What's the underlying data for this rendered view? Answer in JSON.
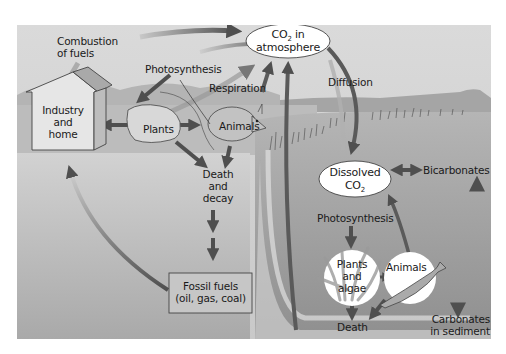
{
  "colors": {
    "sky_top": "#d9d9d9",
    "sky_bottom": "#c4c4c4",
    "mountains": "#a8a8a8",
    "land": "#bdbdbd",
    "ground": "#cfcfcf",
    "water": "#9c9c9c",
    "water_deep": "#8a8a8a",
    "arrow": "#5a5a5a",
    "arrow_light": "#b0b0b0",
    "oval_fill": "#ffffff",
    "box_fill": "#c8c8c8",
    "text": "#1a1a1a"
  },
  "nodes": {
    "co2_atmosphere": {
      "line1": "CO",
      "sub": "2",
      "line1_suffix": " in",
      "line2": "atmosphere"
    },
    "industry_home": {
      "line1": "Industry",
      "line2": "and",
      "line3": "home"
    },
    "plants": {
      "label": "Plants"
    },
    "animals_land": {
      "label": "Animals"
    },
    "death_decay": {
      "line1": "Death",
      "line2": "and",
      "line3": "decay"
    },
    "fossil_fuels": {
      "line1": "Fossil fuels",
      "line2": "(oil, gas, coal)"
    },
    "dissolved_co2": {
      "line1": "Dissolved",
      "line2": "CO",
      "sub": "2"
    },
    "bicarbonates": {
      "label": "Bicarbonates"
    },
    "plants_algae": {
      "line1": "Plants",
      "line2": "and",
      "line3": "algae"
    },
    "animals_water": {
      "label": "Animals"
    },
    "death_water": {
      "label": "Death"
    },
    "carbonates_sediment": {
      "line1": "Carbonates",
      "line2": "in sediment"
    }
  },
  "processes": {
    "combustion": {
      "line1": "Combustion",
      "line2": "of fuels"
    },
    "photosynthesis_land": {
      "label": "Photosynthesis"
    },
    "respiration": {
      "label": "Respiration"
    },
    "diffusion": {
      "label": "Diffusion"
    },
    "photosynthesis_water": {
      "label": "Photosynthesis"
    }
  }
}
